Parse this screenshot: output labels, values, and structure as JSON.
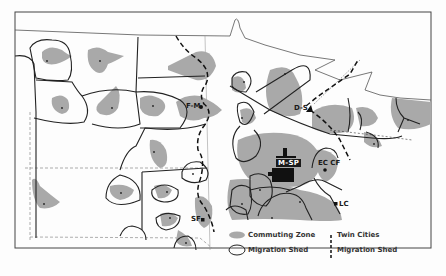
{
  "map": {
    "subject": "Twin Cities migration sheds and commuting zones",
    "colors": {
      "commuting_zone": "#a9a9a9",
      "boundary": "#222222",
      "background": "#fdfdfd",
      "state_line": "#555555"
    },
    "cities": [
      {
        "id": "fm",
        "label": "F-M",
        "x": 197,
        "y": 106
      },
      {
        "id": "ds",
        "label": "D-S",
        "x": 308,
        "y": 109
      },
      {
        "id": "msp",
        "label": "M-SP",
        "x": 283,
        "y": 160
      },
      {
        "id": "ecc",
        "label": "EC CF",
        "x": 324,
        "y": 165
      },
      {
        "id": "lc",
        "label": "LC",
        "x": 336,
        "y": 204
      },
      {
        "id": "sf",
        "label": "SF",
        "x": 200,
        "y": 219
      }
    ]
  },
  "legend": {
    "items": [
      {
        "symbol": "gray-blob",
        "label": "Commuting Zone"
      },
      {
        "symbol": "ellipse-outline",
        "label": "Migration Shed"
      },
      {
        "symbol": "dashed-line",
        "label_line1": "Twin Cities",
        "label_line2": "Migration Shed"
      }
    ]
  }
}
